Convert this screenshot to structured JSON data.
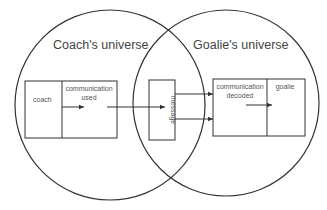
{
  "diagram": {
    "left_circle": {
      "title": "Coach's universe"
    },
    "right_circle": {
      "title": "Goalie's universe"
    },
    "coach_box": {
      "left_label": "coach",
      "right_label_line1": "communication",
      "right_label_line2": "used"
    },
    "message_box": {
      "label": "message"
    },
    "goalie_box": {
      "left_label_line1": "communication",
      "left_label_line2": "decoded",
      "right_label": "goalie"
    },
    "colors": {
      "line": "#333333",
      "text": "#444444",
      "background": "#ffffff"
    }
  }
}
